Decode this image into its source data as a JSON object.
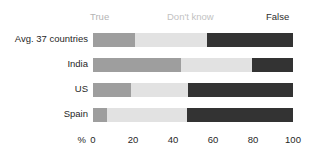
{
  "legend": {
    "items": [
      {
        "label": "True",
        "color": "#9e9e9e"
      },
      {
        "label": "Don't know",
        "color": "#e2e2e2"
      },
      {
        "label": "False",
        "color": "#333333"
      }
    ]
  },
  "axis": {
    "unit": "%",
    "ticks": [
      "0",
      "20",
      "40",
      "60",
      "80",
      "100"
    ]
  },
  "rows": [
    {
      "label": "Avg. 37 countries",
      "true": 21,
      "dont_know": 36,
      "false": 43
    },
    {
      "label": "India",
      "true": 44,
      "dont_know": 35.5,
      "false": 20.5
    },
    {
      "label": "US",
      "true": 19,
      "dont_know": 28.5,
      "false": 52.5
    },
    {
      "label": "Spain",
      "true": 7,
      "dont_know": 40,
      "false": 53
    }
  ],
  "chart_data": {
    "type": "bar",
    "title": "",
    "subtitle": "",
    "xlabel": "%",
    "ylabel": "",
    "xlim": [
      0,
      100
    ],
    "grid": false,
    "stacked": true,
    "orientation": "horizontal",
    "legend_position": "top",
    "categories": [
      "Avg. 37 countries",
      "India",
      "US",
      "Spain"
    ],
    "series": [
      {
        "name": "True",
        "color": "#9e9e9e",
        "values": [
          21,
          44,
          19,
          7
        ]
      },
      {
        "name": "Don't know",
        "color": "#e2e2e2",
        "values": [
          36,
          35.5,
          28.5,
          40
        ]
      },
      {
        "name": "False",
        "color": "#333333",
        "values": [
          43,
          20.5,
          52.5,
          53
        ]
      }
    ],
    "xticks": [
      0,
      20,
      40,
      60,
      80,
      100
    ],
    "xticklabels": [
      "0",
      "20",
      "40",
      "60",
      "80",
      "100"
    ],
    "annotations": []
  }
}
